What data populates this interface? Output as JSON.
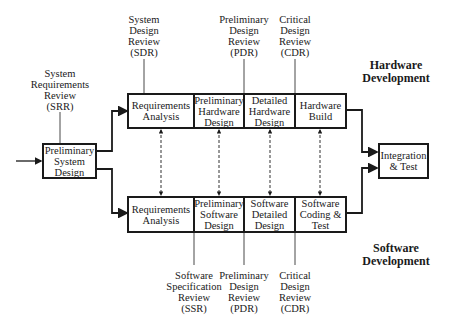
{
  "diagram": {
    "start_box": {
      "label": "Preliminary\nSystem\nDesign"
    },
    "end_box": {
      "label": "Integration\n& Test"
    },
    "hardware": {
      "title": "Hardware\nDevelopment",
      "stages": [
        {
          "label": "Requirements\nAnalysis"
        },
        {
          "label": "Preliminary\nHardware\nDesign"
        },
        {
          "label": "Detailed\nHardware\nDesign"
        },
        {
          "label": "Hardware\nBuild"
        }
      ],
      "reviews": [
        {
          "label": "System\nDesign\nReview\n(SDR)"
        },
        {
          "label": "Preliminary\nDesign\nReview\n(PDR)"
        },
        {
          "label": "Critical\nDesign\nReview\n(CDR)"
        }
      ]
    },
    "software": {
      "title": "Software\nDevelopment",
      "stages": [
        {
          "label": "Requirements\nAnalysis"
        },
        {
          "label": "Preliminary\nSoftware\nDesign"
        },
        {
          "label": "Software\nDetailed\nDesign"
        },
        {
          "label": "Software\nCoding &\nTest"
        }
      ],
      "reviews": [
        {
          "label": "Software\nSpecification\nReview\n(SSR)"
        },
        {
          "label": "Preliminary\nDesign\nReview\n(PDR)"
        },
        {
          "label": "Critical\nDesign\nReview\n(CDR)"
        }
      ]
    },
    "system_review": {
      "label": "System\nRequirements\nReview\n(SRR)"
    },
    "colors": {
      "line": "#1a1a1a",
      "background": "#ffffff"
    }
  }
}
